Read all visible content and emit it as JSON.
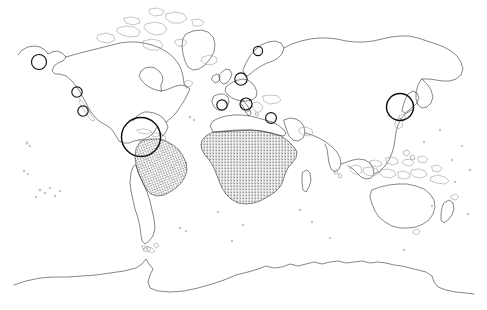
{
  "figure": {
    "kind": "world-map",
    "title": "",
    "width": 487,
    "height": 310,
    "background_color": "#ffffff",
    "coastline_color": "#3b3b3b",
    "marker_color": "#111111",
    "stipple_color": "#1b1b1b",
    "projection_note": "equirectangular-style world outline"
  },
  "legend": {
    "visible": false,
    "entries": []
  },
  "axes": {
    "visible": false,
    "graticule": false,
    "frame": false
  },
  "shaded_regions": [
    {
      "name": "sub-saharan-africa",
      "label": "Sub-Saharan Africa",
      "style": "stipple",
      "color": "#1b1b1b",
      "density": 0.42
    },
    {
      "name": "northern-south-america",
      "label": "Northern South America / Brazil",
      "style": "stipple",
      "color": "#1b1b1b",
      "density": 0.42
    }
  ],
  "markers": [
    {
      "name": "marker-alaska",
      "label": "Alaska",
      "x": 39,
      "y": 62,
      "r": 7.5,
      "size": "small"
    },
    {
      "name": "marker-baja-north",
      "label": "Baja California North",
      "x": 77,
      "y": 92,
      "r": 5.2,
      "size": "small"
    },
    {
      "name": "marker-baja-south",
      "label": "Baja California South",
      "x": 83,
      "y": 111,
      "r": 5.2,
      "size": "small"
    },
    {
      "name": "marker-caribbean",
      "label": "Caribbean / Central America",
      "x": 141,
      "y": 137,
      "r": 19.5,
      "size": "large"
    },
    {
      "name": "marker-baltic",
      "label": "Baltic / Scandinavia",
      "x": 258,
      "y": 51,
      "r": 4.6,
      "size": "small"
    },
    {
      "name": "marker-north-sea",
      "label": "North Sea / Denmark",
      "x": 241,
      "y": 79,
      "r": 6.2,
      "size": "small"
    },
    {
      "name": "marker-iberia",
      "label": "Iberia / Gibraltar",
      "x": 222,
      "y": 105,
      "r": 5.2,
      "size": "small"
    },
    {
      "name": "marker-central-med",
      "label": "Central Mediterranean",
      "x": 246,
      "y": 104,
      "r": 6.0,
      "size": "small"
    },
    {
      "name": "marker-levant",
      "label": "Eastern Mediterranean / Levant",
      "x": 271,
      "y": 118,
      "r": 5.4,
      "size": "small"
    },
    {
      "name": "marker-japan",
      "label": "Japan / Korea",
      "x": 400,
      "y": 107,
      "r": 13.5,
      "size": "large"
    }
  ],
  "marker_counts": {
    "total": 10,
    "small": 8,
    "large": 2
  },
  "landmasses": [
    "North America",
    "South America",
    "Greenland",
    "Europe",
    "Africa",
    "Asia",
    "Australia",
    "New Zealand",
    "Madagascar",
    "Japan",
    "British Isles",
    "Indonesia",
    "Antarctica",
    "Iceland",
    "Philippines"
  ]
}
